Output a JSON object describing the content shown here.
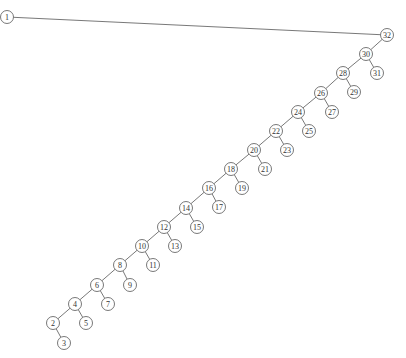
{
  "diagram": {
    "type": "binary-tree",
    "node_radius": 6.5,
    "colors": {
      "stroke": "#555555",
      "fill": "#ffffff",
      "text": "#333333",
      "background": "#ffffff"
    },
    "nodes": [
      {
        "id": "1",
        "x": 7,
        "y": 17
      },
      {
        "id": "32",
        "x": 387,
        "y": 35
      },
      {
        "id": "30",
        "x": 366,
        "y": 54
      },
      {
        "id": "31",
        "x": 377,
        "y": 73
      },
      {
        "id": "28",
        "x": 343,
        "y": 73
      },
      {
        "id": "29",
        "x": 354,
        "y": 92
      },
      {
        "id": "26",
        "x": 321,
        "y": 93
      },
      {
        "id": "27",
        "x": 332,
        "y": 112
      },
      {
        "id": "24",
        "x": 298,
        "y": 112
      },
      {
        "id": "25",
        "x": 309,
        "y": 131
      },
      {
        "id": "22",
        "x": 276,
        "y": 131
      },
      {
        "id": "23",
        "x": 287,
        "y": 150
      },
      {
        "id": "20",
        "x": 254,
        "y": 150
      },
      {
        "id": "21",
        "x": 265,
        "y": 169
      },
      {
        "id": "18",
        "x": 231,
        "y": 169
      },
      {
        "id": "19",
        "x": 242,
        "y": 188
      },
      {
        "id": "16",
        "x": 209,
        "y": 188
      },
      {
        "id": "17",
        "x": 219,
        "y": 207
      },
      {
        "id": "14",
        "x": 186,
        "y": 208
      },
      {
        "id": "15",
        "x": 197,
        "y": 227
      },
      {
        "id": "12",
        "x": 164,
        "y": 227
      },
      {
        "id": "13",
        "x": 175,
        "y": 246
      },
      {
        "id": "10",
        "x": 142,
        "y": 246
      },
      {
        "id": "11",
        "x": 153,
        "y": 265
      },
      {
        "id": "8",
        "x": 120,
        "y": 265
      },
      {
        "id": "9",
        "x": 130,
        "y": 285
      },
      {
        "id": "6",
        "x": 97,
        "y": 285
      },
      {
        "id": "7",
        "x": 108,
        "y": 304
      },
      {
        "id": "4",
        "x": 75,
        "y": 304
      },
      {
        "id": "5",
        "x": 86,
        "y": 323
      },
      {
        "id": "2",
        "x": 53,
        "y": 323
      },
      {
        "id": "3",
        "x": 64,
        "y": 343
      }
    ],
    "edges": [
      [
        "1",
        "32"
      ],
      [
        "32",
        "30"
      ],
      [
        "30",
        "28"
      ],
      [
        "30",
        "31"
      ],
      [
        "28",
        "26"
      ],
      [
        "28",
        "29"
      ],
      [
        "26",
        "24"
      ],
      [
        "26",
        "27"
      ],
      [
        "24",
        "22"
      ],
      [
        "24",
        "25"
      ],
      [
        "22",
        "20"
      ],
      [
        "22",
        "23"
      ],
      [
        "20",
        "18"
      ],
      [
        "20",
        "21"
      ],
      [
        "18",
        "16"
      ],
      [
        "18",
        "19"
      ],
      [
        "16",
        "14"
      ],
      [
        "16",
        "17"
      ],
      [
        "14",
        "12"
      ],
      [
        "14",
        "15"
      ],
      [
        "12",
        "10"
      ],
      [
        "12",
        "13"
      ],
      [
        "10",
        "8"
      ],
      [
        "10",
        "11"
      ],
      [
        "8",
        "6"
      ],
      [
        "8",
        "9"
      ],
      [
        "6",
        "4"
      ],
      [
        "6",
        "7"
      ],
      [
        "4",
        "2"
      ],
      [
        "4",
        "5"
      ],
      [
        "2",
        "3"
      ]
    ]
  }
}
